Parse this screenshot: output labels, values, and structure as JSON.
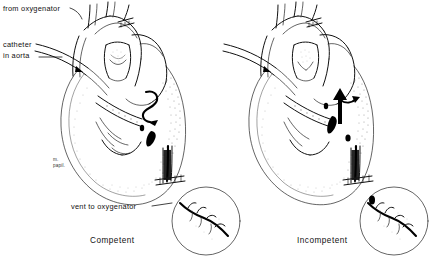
{
  "figure": {
    "background_color": "#ffffff",
    "ink_color": "#111111",
    "panel_count": 2
  },
  "labels": {
    "from_oxygenator": "from oxygenator",
    "catheter_in_aorta_line1": "catheter",
    "catheter_in_aorta_line2": "in aorta",
    "vent_to_oxygenator": "vent to oxygenator",
    "papillary_muscle_line1": "m.",
    "papillary_muscle_line2": "papil."
  },
  "panels": [
    {
      "id": "left",
      "caption": "Competent",
      "flow_marker": "retrograde-perfusion-arrow",
      "inset": "closed-valve-closeup"
    },
    {
      "id": "right",
      "caption": "Incompetent",
      "flow_marker": "regurgitant-jet-arrow",
      "inset": "open-valve-closeup"
    }
  ],
  "icons": {
    "aortic_cannula": "aortic-cannula-icon",
    "vent_cannula": "vent-cannula-icon",
    "cross_clamp": "cross-clamp-icon",
    "purse_string": "purse-string-suture-icon",
    "arrow": "flow-arrow-icon"
  }
}
